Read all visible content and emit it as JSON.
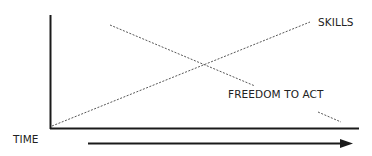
{
  "diagram": {
    "labels": {
      "skills": "SKILLS",
      "freedom": "FREEDOM TO ACT",
      "time": "TIME"
    },
    "colors": {
      "axis": "#1a1a1a",
      "line": "#444444",
      "text": "#222222"
    },
    "series": [
      {
        "name": "SKILLS",
        "trend": "increasing",
        "from": [
          52,
          126
        ],
        "to": [
          310,
          22
        ]
      },
      {
        "name": "FREEDOM TO ACT",
        "trend": "decreasing",
        "from": [
          110,
          25
        ],
        "to": [
          341,
          122
        ]
      }
    ]
  }
}
